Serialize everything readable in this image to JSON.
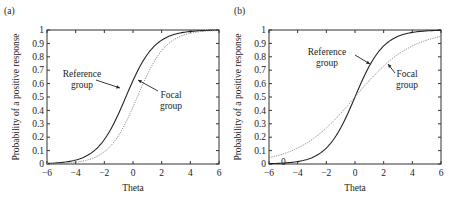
{
  "chart_data": [
    {
      "panel_label": "(a)",
      "type": "line",
      "title": "",
      "xlabel": "Theta",
      "ylabel": "Probability of a positive response",
      "xlim": [
        -6,
        6
      ],
      "ylim": [
        0,
        1
      ],
      "xticks": [
        -6,
        -4,
        -2,
        0,
        2,
        4,
        6
      ],
      "yticks": [
        0,
        0.1,
        0.2,
        0.3,
        0.4,
        0.5,
        0.6,
        0.7,
        0.8,
        0.9,
        1
      ],
      "ytick_labels": [
        "0",
        "0.1",
        "0.2",
        "0.3",
        "0.4",
        "0.5",
        "0.6",
        "0.7",
        "0.8",
        "0.9",
        "1"
      ],
      "grid": false,
      "x": [
        -6,
        -5,
        -4,
        -3,
        -2,
        -1,
        0,
        1,
        2,
        3,
        4,
        5,
        6
      ],
      "series": [
        {
          "name": "Reference group",
          "style": "solid",
          "color": "#222222",
          "model": {
            "a": 1.0,
            "b": -0.5
          },
          "values": [
            0.004,
            0.011,
            0.029,
            0.076,
            0.182,
            0.378,
            0.622,
            0.818,
            0.924,
            0.971,
            0.989,
            0.996,
            0.998
          ]
        },
        {
          "name": "Focal group",
          "style": "dotted",
          "color": "#888888",
          "model": {
            "a": 1.0,
            "b": 0.3
          },
          "values": [
            0.002,
            0.005,
            0.014,
            0.036,
            0.095,
            0.223,
            0.426,
            0.668,
            0.846,
            0.937,
            0.976,
            0.991,
            0.997
          ]
        }
      ],
      "annotations": [
        {
          "text_lines": [
            "Reference",
            "group"
          ],
          "points_to": "Reference group"
        },
        {
          "text_lines": [
            "Focal",
            "group"
          ],
          "points_to": "Focal group"
        }
      ]
    },
    {
      "panel_label": "(b)",
      "type": "line",
      "title": "",
      "xlabel": "Theta",
      "ylabel": "Probability of a positive response",
      "xlim": [
        -6,
        6
      ],
      "ylim": [
        0,
        1
      ],
      "xticks": [
        -6,
        -4,
        -2,
        0,
        2,
        4,
        6
      ],
      "yticks": [
        0,
        0.1,
        0.2,
        0.3,
        0.4,
        0.5,
        0.6,
        0.7,
        0.8,
        0.9,
        1
      ],
      "ytick_labels": [
        "0",
        "0.1",
        "0.2",
        "0.3",
        "0.4",
        "0.5",
        "0.6",
        "0.7",
        "0.8",
        "0.9",
        "1"
      ],
      "grid": false,
      "x": [
        -6,
        -5,
        -4,
        -3,
        -2,
        -1,
        0,
        1,
        2,
        3,
        4,
        5,
        6
      ],
      "series": [
        {
          "name": "Reference group",
          "style": "solid",
          "color": "#222222",
          "model": {
            "a": 1.0,
            "b": 0
          },
          "values": [
            0.002,
            0.007,
            0.018,
            0.047,
            0.119,
            0.269,
            0.5,
            0.731,
            0.881,
            0.953,
            0.982,
            0.993,
            0.998
          ]
        },
        {
          "name": "Focal group",
          "style": "dotted",
          "color": "#888888",
          "model": {
            "a": 0.5,
            "b": 0
          },
          "values": [
            0.047,
            0.076,
            0.119,
            0.182,
            0.269,
            0.378,
            0.5,
            0.622,
            0.731,
            0.818,
            0.881,
            0.924,
            0.953
          ]
        }
      ],
      "annotations": [
        {
          "text_lines": [
            "Reference",
            "group"
          ],
          "points_to": "Reference group"
        },
        {
          "text_lines": [
            "Focal",
            "group"
          ],
          "points_to": "Focal group"
        },
        {
          "text_lines": [
            "0"
          ],
          "note": "stray marker near x=-5, y=0"
        }
      ]
    }
  ]
}
